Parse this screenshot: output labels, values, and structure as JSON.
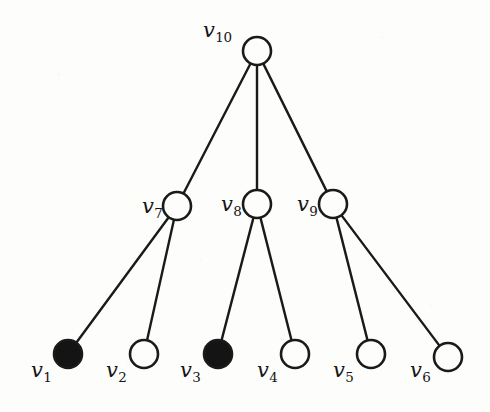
{
  "figure": {
    "background_color": "#fdfdfc",
    "stroke_color": "#1a1a1a",
    "filled_color": "#141414",
    "open_fill_color": "#fdfdfc",
    "width": 490,
    "height": 412
  },
  "chart_data": {
    "type": "diagram",
    "subtype": "node-link-tree",
    "title": "",
    "node_radius": 14,
    "nodes": [
      {
        "id": "v1",
        "label": "v",
        "subscript": "1",
        "x": 68,
        "y": 354,
        "fill": "filled",
        "label_x": 31,
        "label_y": 360,
        "level": 2
      },
      {
        "id": "v2",
        "label": "v",
        "subscript": "2",
        "x": 144,
        "y": 354,
        "fill": "open",
        "label_x": 106,
        "label_y": 360,
        "level": 2
      },
      {
        "id": "v3",
        "label": "v",
        "subscript": "3",
        "x": 218,
        "y": 354,
        "fill": "filled",
        "label_x": 180,
        "label_y": 360,
        "level": 2
      },
      {
        "id": "v4",
        "label": "v",
        "subscript": "4",
        "x": 295,
        "y": 354,
        "fill": "open",
        "label_x": 257,
        "label_y": 360,
        "level": 2
      },
      {
        "id": "v5",
        "label": "v",
        "subscript": "5",
        "x": 371,
        "y": 354,
        "fill": "open",
        "label_x": 333,
        "label_y": 360,
        "level": 2
      },
      {
        "id": "v6",
        "label": "v",
        "subscript": "6",
        "x": 448,
        "y": 357,
        "fill": "open",
        "label_x": 410,
        "label_y": 360,
        "level": 2
      },
      {
        "id": "v7",
        "label": "v",
        "subscript": "7",
        "x": 177,
        "y": 206,
        "fill": "open",
        "label_x": 142,
        "label_y": 196,
        "level": 1
      },
      {
        "id": "v8",
        "label": "v",
        "subscript": "8",
        "x": 257,
        "y": 204,
        "fill": "open",
        "label_x": 221,
        "label_y": 194,
        "level": 1
      },
      {
        "id": "v9",
        "label": "v",
        "subscript": "9",
        "x": 333,
        "y": 204,
        "fill": "open",
        "label_x": 297,
        "label_y": 194,
        "level": 1
      },
      {
        "id": "v10",
        "label": "v",
        "subscript": "10",
        "x": 257,
        "y": 51,
        "fill": "open",
        "label_x": 203,
        "label_y": 20,
        "level": 0
      }
    ],
    "edges": [
      {
        "source": "v10",
        "target": "v7"
      },
      {
        "source": "v10",
        "target": "v8"
      },
      {
        "source": "v10",
        "target": "v9"
      },
      {
        "source": "v7",
        "target": "v1"
      },
      {
        "source": "v7",
        "target": "v2"
      },
      {
        "source": "v8",
        "target": "v3"
      },
      {
        "source": "v8",
        "target": "v4"
      },
      {
        "source": "v9",
        "target": "v5"
      },
      {
        "source": "v9",
        "target": "v6"
      }
    ],
    "legend": {
      "filled_meaning": "",
      "open_meaning": ""
    },
    "annotations": []
  }
}
